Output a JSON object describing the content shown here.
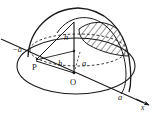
{
  "figure": {
    "type": "geometry-diagram",
    "background_color": "#ffffff",
    "stroke_color": "#1a1a1a",
    "hatch_color": "#1a1a1a"
  },
  "labels": {
    "neg_a": "−a",
    "pos_a": "a",
    "point_p": "P",
    "point_o": "O",
    "height_upper": "h",
    "height_lower": "h",
    "radius_a": "a",
    "axis_x": "x"
  },
  "icon_names": {
    "axis_arrow": "arrow-right-icon",
    "hatched_region": "hatched-section-icon"
  },
  "geometry": {
    "base_ellipse": {
      "cx": 76,
      "cy": 66,
      "rx": 59,
      "ry": 28
    },
    "dashed_ellipse": {
      "cx": 78,
      "cy": 50,
      "rx": 48,
      "ry": 16
    },
    "origin": {
      "x": 74,
      "y": 73
    },
    "apex": {
      "x": 74,
      "y": 22
    },
    "axis_left_end": {
      "x": 2,
      "y": 40
    },
    "axis_right_end": {
      "x": 150,
      "y": 106
    },
    "intersection_left": {
      "x": 20,
      "y": 48
    },
    "intersection_right": {
      "x": 123,
      "y": 94
    }
  }
}
